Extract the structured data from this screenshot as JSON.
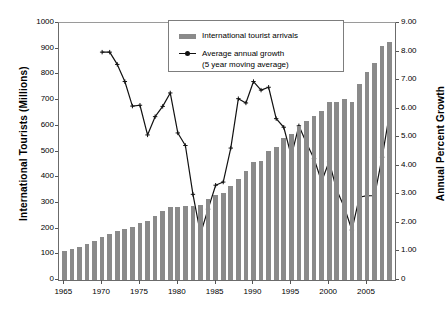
{
  "chart_data": {
    "type": "bar",
    "title": "",
    "xlabel": "",
    "ylabel": "International Tourists (Millions)",
    "y2label": "Annual Percent Growth",
    "grid": false,
    "legend_position": "top-center",
    "xlim": [
      1964.3,
      2008.7
    ],
    "ylim": [
      0,
      1000
    ],
    "y2lim": [
      0,
      9
    ],
    "x_tick_labels": [
      "1965",
      "1970",
      "1975",
      "1980",
      "1985",
      "1990",
      "1995",
      "2000",
      "2005"
    ],
    "x_ticks": [
      1965,
      1970,
      1975,
      1980,
      1985,
      1990,
      1995,
      2000,
      2005
    ],
    "y_tick_labels": [
      "0",
      "100",
      "200",
      "300",
      "400",
      "500",
      "600",
      "700",
      "800",
      "900",
      "1000"
    ],
    "y_ticks": [
      0,
      100,
      200,
      300,
      400,
      500,
      600,
      700,
      800,
      900,
      1000
    ],
    "y2_tick_labels": [
      "0",
      "1.00",
      "2.00",
      "3.00",
      "4.00",
      "5.00",
      "6.00",
      "7.00",
      "8.00",
      "9.00"
    ],
    "y2_ticks": [
      0,
      1,
      2,
      3,
      4,
      5,
      6,
      7,
      8,
      9
    ],
    "categories": [
      1965,
      1966,
      1967,
      1968,
      1969,
      1970,
      1971,
      1972,
      1973,
      1974,
      1975,
      1976,
      1977,
      1978,
      1979,
      1980,
      1981,
      1982,
      1983,
      1984,
      1985,
      1986,
      1987,
      1988,
      1989,
      1990,
      1991,
      1992,
      1993,
      1994,
      1995,
      1996,
      1997,
      1998,
      1999,
      2000,
      2001,
      2002,
      2003,
      2004,
      2005,
      2006,
      2007,
      2008
    ],
    "series": [
      {
        "name": "International tourist arrivals",
        "axis": "left",
        "type": "bar",
        "color": "#8a8a8a",
        "unit": "millions",
        "values": [
          112,
          122,
          130,
          140,
          153,
          166,
          179,
          190,
          197,
          206,
          222,
          229,
          250,
          268,
          283,
          286,
          288,
          287,
          290,
          317,
          330,
          338,
          364,
          395,
          426,
          458,
          464,
          503,
          518,
          553,
          570,
          600,
          619,
          637,
          657,
          693,
          692,
          703,
          691,
          761,
          808,
          844,
          910,
          925
        ]
      },
      {
        "name": "Average annual growth (5 year moving average)",
        "axis": "right",
        "type": "line",
        "color": "#111111",
        "marker": "plus",
        "unit": "percent",
        "x": [
          1970,
          1971,
          1972,
          1973,
          1974,
          1975,
          1976,
          1977,
          1978,
          1979,
          1980,
          1981,
          1982,
          1983,
          1984,
          1985,
          1986,
          1987,
          1988,
          1989,
          1990,
          1991,
          1992,
          1993,
          1994,
          1995,
          1996,
          1997,
          1998,
          1999,
          2000,
          2001,
          2002,
          2003,
          2004,
          2005,
          2006,
          2007,
          2008
        ],
        "values": [
          7.98,
          7.98,
          7.55,
          6.95,
          6.09,
          6.12,
          5.08,
          5.72,
          6.08,
          6.55,
          5.15,
          4.71,
          3.0,
          1.62,
          2.48,
          3.32,
          3.43,
          4.62,
          6.35,
          6.2,
          6.95,
          6.65,
          6.75,
          5.65,
          5.35,
          4.35,
          5.4,
          4.8,
          4.25,
          3.45,
          4.15,
          3.15,
          2.55,
          1.75,
          2.9,
          2.95,
          2.95,
          4.3,
          5.85
        ]
      }
    ]
  },
  "legend": {
    "entries": [
      {
        "label": "International tourist arrivals",
        "marker": "bar-swatch"
      },
      {
        "label": "Average annual growth",
        "label2": "(5 year moving average)",
        "marker": "line-plus"
      }
    ]
  },
  "axes": {
    "left_title": "International Tourists (Millions)",
    "right_title": "Annual Percent Growth"
  }
}
